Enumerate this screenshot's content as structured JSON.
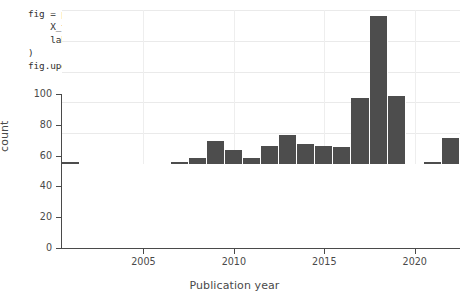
{
  "code_cell": {
    "lines": [
      "fig = px.histogram(",
      "    X_train.loc[X_train[\"timestamp\"] > \"2000\", \"timestamp\"],",
      "    labels={\"value\": \"Publication year\"}, width=550, height=250,",
      ")",
      "fig.update_layout(showlegend=False)"
    ]
  },
  "colors": {
    "bar": "#4d4d4d",
    "axis": "#4a4a4a",
    "grid": "#eaeaea",
    "text": "#494949",
    "background": "#ffffff"
  },
  "chart_data": {
    "type": "bar",
    "title": "",
    "subtitle": "",
    "xlabel": "Publication year",
    "ylabel": "count",
    "xlim": [
      2000.5,
      2022.5
    ],
    "ylim": [
      0,
      100
    ],
    "grid": true,
    "legend": false,
    "legend_position": "none",
    "bin_width": 1,
    "xtick_labels": [
      "2005",
      "2010",
      "2015",
      "2020"
    ],
    "xticks": [
      2005,
      2010,
      2015,
      2020
    ],
    "ytick_labels": [
      "0",
      "20",
      "40",
      "60",
      "80",
      "100"
    ],
    "yticks": [
      0,
      20,
      40,
      60,
      80,
      100
    ],
    "categories": [
      2001,
      2002,
      2003,
      2004,
      2005,
      2006,
      2007,
      2008,
      2009,
      2010,
      2011,
      2012,
      2013,
      2014,
      2015,
      2016,
      2017,
      2018,
      2019,
      2020,
      2021,
      2022
    ],
    "values": [
      1,
      0,
      0,
      0,
      0,
      0,
      1,
      4,
      15,
      9,
      4,
      12,
      19,
      13,
      12,
      11,
      43,
      96,
      44,
      0,
      1,
      17
    ]
  }
}
